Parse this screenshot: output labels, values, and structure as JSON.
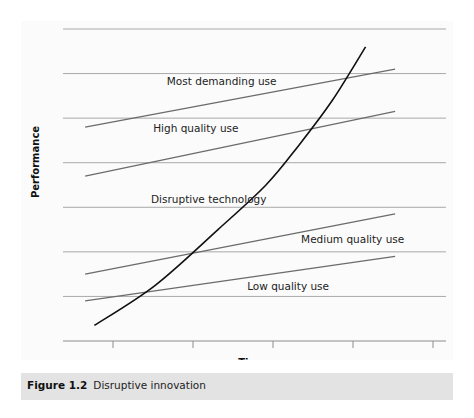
{
  "figure": {
    "number": "Figure 1.2",
    "title": "Disruptive innovation"
  },
  "chart_data": {
    "type": "line",
    "title": "Disruptive innovation",
    "xlabel": "Time",
    "ylabel": "Performance",
    "xlim": [
      0,
      10
    ],
    "ylim": [
      0,
      7
    ],
    "grid": true,
    "x_ticks": [
      "",
      "",
      "",
      "",
      ""
    ],
    "series": [
      {
        "name": "Most demanding use",
        "kind": "linear",
        "x": [
          0.6,
          9.0
        ],
        "y": [
          4.8,
          6.1
        ],
        "color": "#6b6b6b"
      },
      {
        "name": "High quality use",
        "kind": "linear",
        "x": [
          0.6,
          9.0
        ],
        "y": [
          3.7,
          5.15
        ],
        "color": "#6b6b6b"
      },
      {
        "name": "Medium quality use",
        "kind": "linear",
        "x": [
          0.6,
          9.0
        ],
        "y": [
          1.5,
          2.85
        ],
        "color": "#6b6b6b"
      },
      {
        "name": "Low quality use",
        "kind": "linear",
        "x": [
          0.6,
          9.0
        ],
        "y": [
          0.9,
          1.9
        ],
        "color": "#6b6b6b"
      },
      {
        "name": "Disruptive technology",
        "kind": "curve",
        "x": [
          0.85,
          2.5,
          4.2,
          5.5,
          6.4,
          7.3,
          8.2
        ],
        "y": [
          0.35,
          1.25,
          2.5,
          3.5,
          4.4,
          5.4,
          6.6
        ],
        "color": "#111111"
      }
    ],
    "annotations": [
      {
        "text": "Most demanding use",
        "x": 4.3,
        "y": 5.75
      },
      {
        "text": "High quality use",
        "x": 3.6,
        "y": 4.7
      },
      {
        "text": "Disruptive technology",
        "x": 3.95,
        "y": 3.1
      },
      {
        "text": "Medium quality use",
        "x": 7.85,
        "y": 2.2
      },
      {
        "text": "Low quality use",
        "x": 6.1,
        "y": 1.15
      }
    ]
  }
}
